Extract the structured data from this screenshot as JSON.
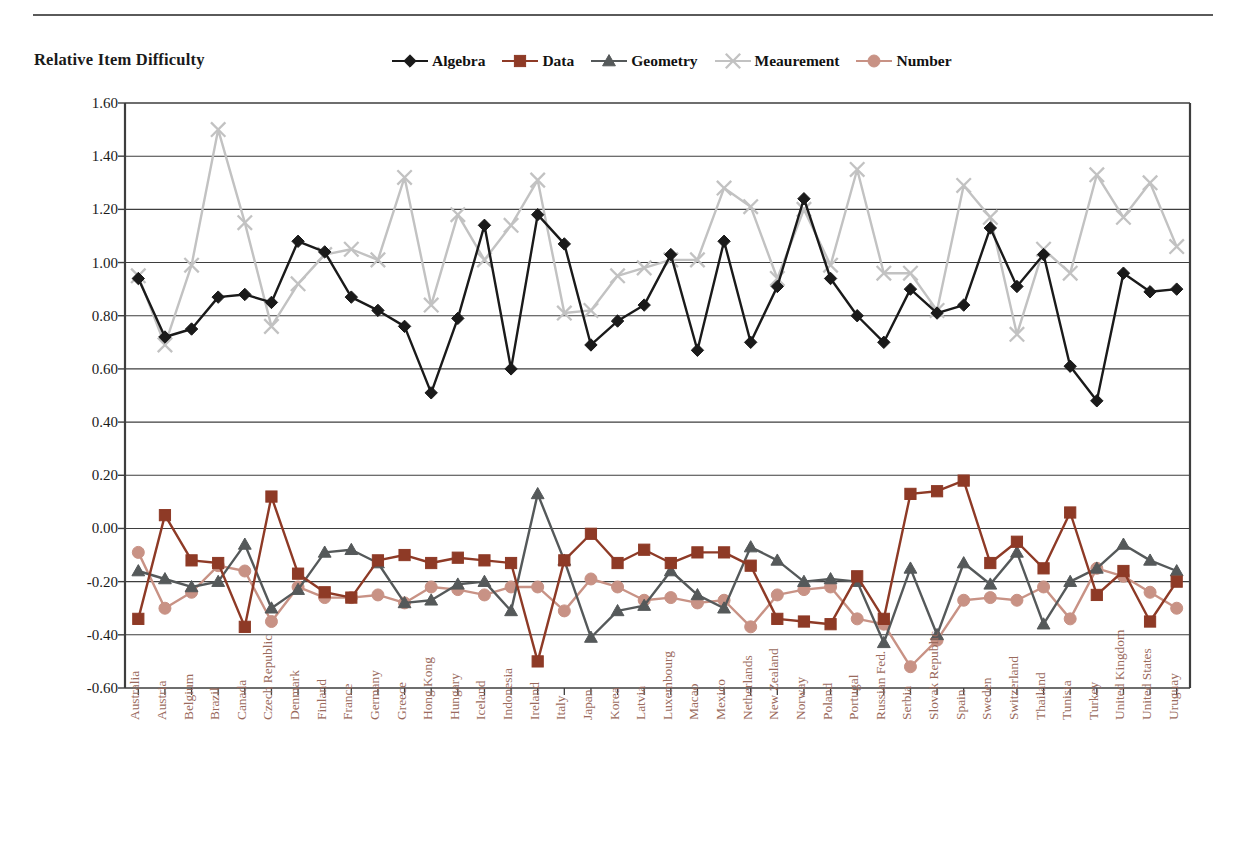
{
  "figure": {
    "title": "Relative Item Difficulty",
    "has_top_rule": true
  },
  "legend": {
    "position": "top-center",
    "entries": [
      {
        "label": "Algebra",
        "color": "#1a1a1a",
        "marker": "diamond"
      },
      {
        "label": "Data",
        "color": "#8e3a26",
        "marker": "square"
      },
      {
        "label": "Geometry",
        "color": "#55595a",
        "marker": "triangle"
      },
      {
        "label": "Meaurement",
        "color": "#c2c2c2",
        "marker": "x"
      },
      {
        "label": "Number",
        "color": "#c89285",
        "marker": "circle"
      }
    ]
  },
  "axes": {
    "y_tick_labels": [
      "1.60",
      "1.40",
      "1.20",
      "1.00",
      "0.80",
      "0.60",
      "0.40",
      "0.20",
      "0.00",
      "-0.20",
      "-0.40",
      "-0.60"
    ],
    "y_min": -0.6,
    "y_max": 1.6,
    "y_step": 0.2,
    "grid": "horizontal",
    "x_label_color": "#9a6a5c"
  },
  "chart_data": {
    "type": "line",
    "title": "Relative Item Difficulty",
    "xlabel": "",
    "ylabel": "",
    "ylim": [
      -0.6,
      1.6
    ],
    "ytick_step": 0.2,
    "grid": true,
    "legend_position": "top-center",
    "categories": [
      "Australia",
      "Austria",
      "Belgium",
      "Brazil",
      "Canada",
      "Czech Republic",
      "Denmark",
      "Finland",
      "France",
      "Germany",
      "Greece",
      "Hong Kong",
      "Hungary",
      "Iceland",
      "Indonesia",
      "Ireland",
      "Italy",
      "Japan",
      "Korea",
      "Latvia",
      "Luxembourg",
      "Macao",
      "Mexico",
      "Netherlands",
      "New Zealand",
      "Norway",
      "Poland",
      "Portugal",
      "Russian Fed.",
      "Serbia",
      "Slovak Republic",
      "Spain",
      "Sweden",
      "Switzerland",
      "Thailand",
      "Tunisia",
      "Turkey",
      "United Kingdom",
      "United States",
      "Uruguay"
    ],
    "series": [
      {
        "name": "Algebra",
        "color": "#1a1a1a",
        "marker": "diamond",
        "values": [
          0.94,
          0.72,
          0.75,
          0.87,
          0.88,
          0.85,
          1.08,
          1.04,
          0.87,
          0.82,
          0.76,
          0.51,
          0.79,
          1.14,
          0.6,
          1.18,
          1.07,
          0.69,
          0.78,
          0.84,
          1.03,
          0.67,
          1.08,
          0.7,
          0.91,
          1.24,
          0.94,
          0.8,
          0.7,
          0.9,
          0.81,
          0.84,
          1.13,
          0.91,
          1.03,
          0.61,
          0.48,
          0.96,
          0.89,
          0.9
        ]
      },
      {
        "name": "Data",
        "color": "#8e3a26",
        "marker": "square",
        "values": [
          -0.34,
          0.05,
          -0.12,
          -0.13,
          -0.37,
          0.12,
          -0.17,
          -0.24,
          -0.26,
          -0.12,
          -0.1,
          -0.13,
          -0.11,
          -0.12,
          -0.13,
          -0.5,
          -0.12,
          -0.02,
          -0.13,
          -0.08,
          -0.13,
          -0.09,
          -0.09,
          -0.14,
          -0.34,
          -0.35,
          -0.36,
          -0.18,
          -0.34,
          0.13,
          0.14,
          0.18,
          -0.13,
          -0.05,
          -0.15,
          0.06,
          -0.25,
          -0.16,
          -0.35,
          -0.2
        ]
      },
      {
        "name": "Geometry",
        "color": "#55595a",
        "marker": "triangle",
        "values": [
          -0.16,
          -0.19,
          -0.22,
          -0.2,
          -0.06,
          -0.3,
          -0.23,
          -0.09,
          -0.08,
          -0.13,
          -0.28,
          -0.27,
          -0.21,
          -0.2,
          -0.31,
          0.13,
          -0.12,
          -0.41,
          -0.31,
          -0.29,
          -0.16,
          -0.25,
          -0.3,
          -0.07,
          -0.12,
          -0.2,
          -0.19,
          -0.2,
          -0.43,
          -0.15,
          -0.4,
          -0.13,
          -0.21,
          -0.09,
          -0.36,
          -0.2,
          -0.15,
          -0.06,
          -0.12,
          -0.16
        ]
      },
      {
        "name": "Meaurement",
        "color": "#c2c2c2",
        "marker": "x",
        "values": [
          0.95,
          0.69,
          0.99,
          1.5,
          1.15,
          0.76,
          0.92,
          1.03,
          1.05,
          1.01,
          1.32,
          0.84,
          1.18,
          1.01,
          1.14,
          1.31,
          0.81,
          0.82,
          0.95,
          0.98,
          1.01,
          1.01,
          1.28,
          1.21,
          0.94,
          1.2,
          0.99,
          1.35,
          0.96,
          0.96,
          0.82,
          1.29,
          1.17,
          0.73,
          1.05,
          0.96,
          1.33,
          1.17,
          1.3,
          1.06
        ]
      },
      {
        "name": "Number",
        "color": "#c89285",
        "marker": "circle",
        "values": [
          -0.09,
          -0.3,
          -0.24,
          -0.14,
          -0.16,
          -0.35,
          -0.22,
          -0.26,
          -0.26,
          -0.25,
          -0.28,
          -0.22,
          -0.23,
          -0.25,
          -0.22,
          -0.22,
          -0.31,
          -0.19,
          -0.22,
          -0.27,
          -0.26,
          -0.28,
          -0.27,
          -0.37,
          -0.25,
          -0.23,
          -0.22,
          -0.34,
          -0.36,
          -0.52,
          -0.42,
          -0.27,
          -0.26,
          -0.27,
          -0.22,
          -0.34,
          -0.15,
          -0.18,
          -0.24,
          -0.3
        ]
      }
    ]
  }
}
